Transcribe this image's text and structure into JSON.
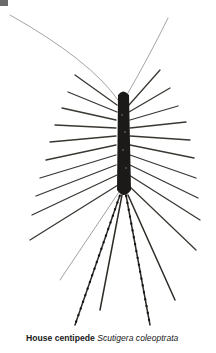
{
  "figure": {
    "top_text_partial": "...",
    "caption": {
      "common_name": "House centipede",
      "scientific_name": "Scutigera coleoptrata"
    },
    "colors": {
      "body": "#1c1a18",
      "legs": "#3a3632",
      "antennae": "#6a6660",
      "background": "#ffffff"
    }
  }
}
